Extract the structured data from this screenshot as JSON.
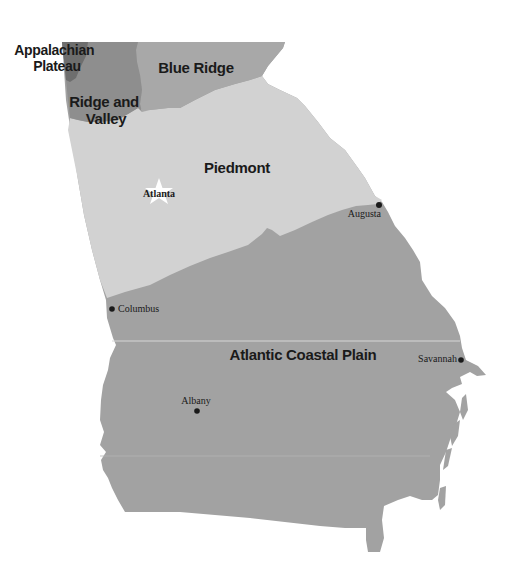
{
  "map": {
    "title": "Georgia physiographic regions",
    "regions": [
      {
        "name": "Appalachian Plateau",
        "label_lines": [
          "Appalachian",
          "Plateau"
        ],
        "color": "#6e6e6e"
      },
      {
        "name": "Ridge and Valley",
        "label_lines": [
          "Ridge and",
          "Valley"
        ],
        "color": "#8e8e8e"
      },
      {
        "name": "Blue Ridge",
        "label_lines": [
          "Blue Ridge"
        ],
        "color": "#a8a8a8"
      },
      {
        "name": "Piedmont",
        "label_lines": [
          "Piedmont"
        ],
        "color": "#d2d2d2"
      },
      {
        "name": "Atlantic Coastal Plain",
        "label_lines": [
          "Atlantic Coastal Plain"
        ],
        "color": "#a2a2a2"
      }
    ],
    "cities": [
      {
        "name": "Atlanta",
        "marker": "star-icon",
        "is_capital": true
      },
      {
        "name": "Augusta",
        "marker": "dot-icon"
      },
      {
        "name": "Columbus",
        "marker": "dot-icon"
      },
      {
        "name": "Savannah",
        "marker": "dot-icon"
      },
      {
        "name": "Albany",
        "marker": "dot-icon"
      }
    ]
  }
}
